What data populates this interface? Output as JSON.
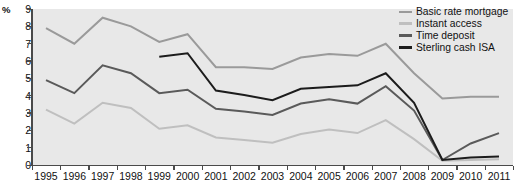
{
  "axes": {
    "ylabel": "%",
    "yticks": [
      "0",
      "1",
      "2",
      "3",
      "4",
      "5",
      "6",
      "7",
      "8",
      "9"
    ],
    "xticks": [
      "1995",
      "1996",
      "1997",
      "1998",
      "1999",
      "2000",
      "2001",
      "2002",
      "2003",
      "2004",
      "2005",
      "2006",
      "2007",
      "2008",
      "2009",
      "2010",
      "2011"
    ]
  },
  "legend": {
    "items": [
      {
        "label": "Basic rate mortgage",
        "color": "#9a9a9a"
      },
      {
        "label": "Instant access",
        "color": "#bfbfbf"
      },
      {
        "label": "Time deposit",
        "color": "#5a5a5a"
      },
      {
        "label": "Sterling cash ISA",
        "color": "#1c1c1c"
      }
    ]
  },
  "chart_data": {
    "type": "line",
    "title": "",
    "xlabel": "",
    "ylabel": "%",
    "ylim": [
      0,
      9
    ],
    "grid": false,
    "legend_position": "top-right",
    "x": [
      1995,
      1996,
      1997,
      1998,
      1999,
      2000,
      2001,
      2002,
      2003,
      2004,
      2005,
      2006,
      2007,
      2008,
      2009,
      2010,
      2011
    ],
    "series": [
      {
        "name": "Basic rate mortgage",
        "color": "#9a9a9a",
        "values": [
          7.9,
          7.0,
          8.5,
          8.0,
          7.1,
          7.55,
          5.65,
          5.65,
          5.55,
          6.2,
          6.4,
          6.3,
          7.0,
          5.3,
          3.85,
          3.95,
          3.95
        ]
      },
      {
        "name": "Instant access",
        "color": "#bfbfbf",
        "values": [
          3.2,
          2.4,
          3.6,
          3.3,
          2.1,
          2.3,
          1.6,
          1.45,
          1.3,
          1.8,
          2.05,
          1.85,
          2.6,
          1.5,
          0.25,
          0.3,
          0.35
        ]
      },
      {
        "name": "Time deposit",
        "color": "#5a5a5a",
        "values": [
          4.9,
          4.15,
          5.75,
          5.3,
          4.15,
          4.35,
          3.25,
          3.1,
          2.9,
          3.55,
          3.8,
          3.55,
          4.55,
          3.15,
          0.3,
          1.25,
          1.85
        ]
      },
      {
        "name": "Sterling cash ISA",
        "color": "#1c1c1c",
        "values": [
          null,
          null,
          null,
          null,
          6.25,
          6.45,
          4.3,
          4.05,
          3.75,
          4.4,
          4.5,
          4.6,
          5.3,
          3.6,
          0.3,
          0.45,
          0.5
        ]
      }
    ]
  }
}
